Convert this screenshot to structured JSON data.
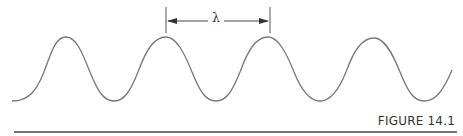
{
  "figure": {
    "caption": "FIGURE 14.1",
    "wavelength_label": "λ",
    "stroke_color": "#777777",
    "rule_color": "#444444"
  }
}
